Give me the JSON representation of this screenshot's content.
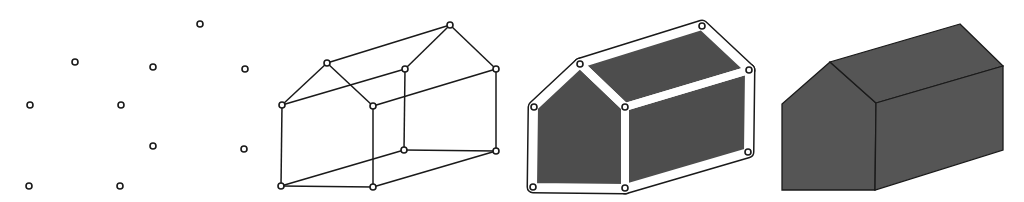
{
  "figure": {
    "colors": {
      "background": "#ffffff",
      "stroke": "#1a1a1a",
      "face_fill": "#4d4d4d",
      "solid_fill": "#555555",
      "vertex_fill": "#ffffff"
    },
    "panels": [
      {
        "id": "vertices",
        "vertices": [
          [
            200,
            24
          ],
          [
            75,
            62
          ],
          [
            153,
            67
          ],
          [
            245,
            69
          ],
          [
            30,
            105
          ],
          [
            121,
            105
          ],
          [
            153,
            146
          ],
          [
            244,
            149
          ],
          [
            29,
            186
          ],
          [
            120,
            186
          ]
        ]
      },
      {
        "id": "wireframe",
        "vertices": [
          [
            450,
            25
          ],
          [
            327,
            63
          ],
          [
            405,
            69
          ],
          [
            496,
            69
          ],
          [
            282,
            105
          ],
          [
            373,
            106
          ],
          [
            404,
            150
          ],
          [
            496,
            151
          ],
          [
            281,
            186
          ],
          [
            373,
            187
          ]
        ],
        "edges": [
          [
            0,
            1
          ],
          [
            0,
            2
          ],
          [
            0,
            3
          ],
          [
            1,
            4
          ],
          [
            1,
            5
          ],
          [
            2,
            4
          ],
          [
            3,
            5
          ],
          [
            4,
            8
          ],
          [
            5,
            9
          ],
          [
            2,
            6
          ],
          [
            3,
            7
          ],
          [
            8,
            9
          ],
          [
            8,
            6
          ],
          [
            9,
            7
          ],
          [
            6,
            7
          ]
        ]
      },
      {
        "id": "faces",
        "vertices": [
          [
            702,
            26
          ],
          [
            580,
            64
          ],
          [
            749,
            70
          ],
          [
            534,
            107
          ],
          [
            625,
            107
          ],
          [
            748,
            152
          ],
          [
            533,
            187
          ],
          [
            625,
            188
          ]
        ],
        "faces": [
          [
            [
              580,
              64
            ],
            [
              534,
              107
            ],
            [
              533,
              187
            ],
            [
              625,
              188
            ],
            [
              625,
              107
            ]
          ],
          [
            [
              702,
              26
            ],
            [
              580,
              64
            ],
            [
              625,
              107
            ],
            [
              749,
              70
            ]
          ],
          [
            [
              625,
              107
            ],
            [
              749,
              70
            ],
            [
              748,
              152
            ],
            [
              625,
              188
            ]
          ]
        ]
      },
      {
        "id": "solid",
        "faces": [
          [
            [
              830,
              62
            ],
            [
              782,
              104
            ],
            [
              782,
              190
            ],
            [
              875,
              190
            ],
            [
              876,
              103
            ]
          ],
          [
            [
              960,
              24
            ],
            [
              830,
              62
            ],
            [
              876,
              103
            ],
            [
              1003,
              66
            ]
          ],
          [
            [
              876,
              103
            ],
            [
              1003,
              66
            ],
            [
              1003,
              150
            ],
            [
              875,
              190
            ]
          ]
        ]
      }
    ]
  }
}
